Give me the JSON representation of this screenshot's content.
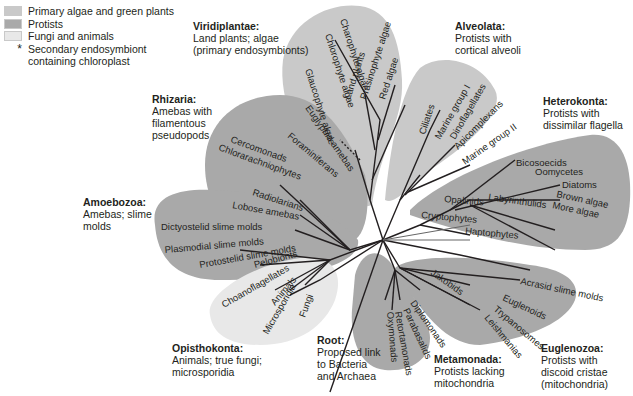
{
  "legend": {
    "items": [
      {
        "label": "Primary algae and green plants",
        "color": "#c9c9c9"
      },
      {
        "label": "Protists",
        "color": "#a8a8a8"
      },
      {
        "label": "Fungi and animals",
        "color": "#e6e6e6"
      }
    ],
    "star_symbol": "*",
    "star_label_1": "Secondary endosymbiont",
    "star_label_2": "containing chloroplast"
  },
  "groups": {
    "viridiplantae": {
      "name": "Viridiplantae:",
      "desc": "Land plants; algae\n(primary endosymbionts)"
    },
    "alveolata": {
      "name": "Alveolata:",
      "desc": "Protists with\ncortical alveoli"
    },
    "heterokonta": {
      "name": "Heterokonta:",
      "desc": "Protists with\ndissimilar flagella"
    },
    "rhizaria": {
      "name": "Rhizaria:",
      "desc": "Amebas with\nfilamentous\npseudopods"
    },
    "amoebozoa": {
      "name": "Amoebozoa:",
      "desc": "Amebas; slime\nmolds"
    },
    "opisthokonta": {
      "name": "Opisthokonta:",
      "desc": "Animals; true fungi;\nmicrosporidia"
    },
    "root": {
      "name": "Root:",
      "desc": "Proposed link\nto Bacteria\nand Archaea"
    },
    "metamonada": {
      "name": "Metamonada:",
      "desc": "Protists lacking\nmitochondria"
    },
    "euglenozoa": {
      "name": "Euglenozoa:",
      "desc": "Protists with\ndiscoid cristae\n(mitochondria)"
    }
  },
  "taxa": {
    "charophyte": "Charophyte algae",
    "chlorophyte": "Chlorophyte algae",
    "land_plants": "Land plants",
    "prasinophyte": "Prasinophyte algae",
    "red_algae": "Red algae",
    "glaucophyte": "Glaucophyte algae",
    "ciliates": "Ciliates",
    "marine1": "Marine group I",
    "dinoflagellates": "Dinoflagellates",
    "apicomplexans": "Apicomplexans",
    "marine2": "Marine group II",
    "bicosoecids": "Bicosoecids",
    "oomycetes": "Oomycetes",
    "diatoms": "Diatoms",
    "brown_algae": "Brown algae",
    "more_algae": "More algae",
    "opalinids": "Opalinids",
    "labyrinthulids": "Labyrinthulids",
    "cryptophytes": "Cryptophytes",
    "haptophytes": "Haptophytes",
    "euglyphid": "Euglyphid amebas",
    "foraminiferans": "Foraminiferans",
    "cercomonads": "Cercomonads",
    "chlorarachniophytes": "Chlorarachniophytes",
    "radiolarians": "Radiolarians",
    "lobose": "Lobose amebas",
    "dictyostelid": "Dictyostelid slime molds",
    "plasmodial": "Plasmodial slime molds",
    "protostelid": "Protostelid slime molds",
    "pelobionts": "Pelobionts",
    "choanoflagellates": "Choanoflagellates",
    "animals": "Animals",
    "microsporidia": "Microsporidia",
    "fungi": "Fungi",
    "jakobids": "Jakobids",
    "diplomonads": "Diplomonads",
    "parabasalids": "Parabasalids",
    "retortamonads": "Retortamonads",
    "oxymonads": "Oxymonads",
    "acrasid": "Acrasid slime molds",
    "euglenoids": "Euglenoids",
    "trypanosomes": "Trypanosomes",
    "leishmanias": "Leishmanias",
    "star": "*"
  },
  "colors": {
    "primary_algae": "#c9c9c9",
    "protists": "#a9a9a9",
    "fungi_animals": "#e8e8e8",
    "branch": "#231f20"
  }
}
